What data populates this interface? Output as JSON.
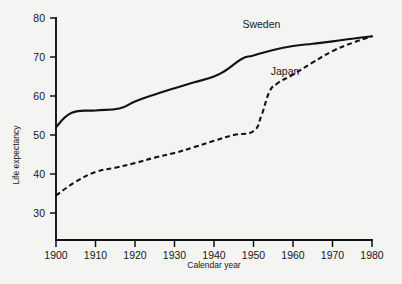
{
  "chart_data": {
    "type": "line",
    "title": "",
    "xlabel": "Calendar year",
    "ylabel": "Life expectancy",
    "xlim": [
      1900,
      1980
    ],
    "ylim": [
      26,
      80
    ],
    "xticks": [
      1900,
      1910,
      1920,
      1930,
      1940,
      1950,
      1960,
      1970,
      1980
    ],
    "xticklabels": [
      "1900",
      "1910",
      "1920",
      "1930",
      "1940",
      "1950",
      "1960",
      "1970",
      "1980"
    ],
    "yticks": [
      30,
      40,
      50,
      60,
      70,
      80
    ],
    "yticklabels": [
      "30",
      "40",
      "50",
      "60",
      "70",
      "80"
    ],
    "grid": false,
    "legend_position": "inline-annotation",
    "series": [
      {
        "name": "Sweden",
        "style": "solid",
        "color": "#111216",
        "label_x": 1952,
        "label_y": 77.5,
        "x": [
          1900,
          1904,
          1910,
          1916,
          1920,
          1925,
          1930,
          1935,
          1940,
          1943,
          1947,
          1950,
          1955,
          1960,
          1965,
          1970,
          1975,
          1980
        ],
        "values": [
          52.0,
          55.7,
          56.3,
          56.8,
          58.6,
          60.4,
          62.0,
          63.5,
          65.0,
          66.6,
          69.5,
          70.4,
          71.8,
          72.8,
          73.4,
          74.0,
          74.7,
          75.3
        ]
      },
      {
        "name": "Japan",
        "style": "dashed",
        "color": "#111216",
        "label_x": 1958,
        "label_y": 65.5,
        "x": [
          1900,
          1905,
          1910,
          1915,
          1920,
          1925,
          1930,
          1935,
          1940,
          1945,
          1950,
          1952,
          1954,
          1956,
          1960,
          1965,
          1970,
          1975,
          1980
        ],
        "values": [
          34.5,
          38.0,
          40.5,
          41.6,
          42.8,
          44.2,
          45.4,
          46.9,
          48.5,
          50.0,
          51.0,
          55.0,
          61.0,
          63.2,
          65.5,
          68.6,
          71.5,
          73.6,
          75.3
        ]
      }
    ]
  },
  "axes": {
    "y_title": "Life expectancy",
    "x_title": "Calendar year"
  }
}
